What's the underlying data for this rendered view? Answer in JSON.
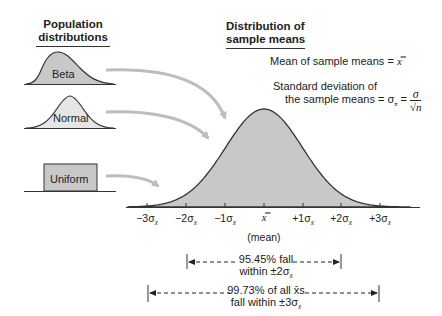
{
  "headers": {
    "population": [
      "Population",
      "distributions"
    ],
    "sampling": [
      "Distribution of",
      "sample means"
    ]
  },
  "population_shapes": [
    {
      "label": "Beta",
      "shape": "right-skewed"
    },
    {
      "label": "Normal",
      "shape": "bell"
    },
    {
      "label": "Uniform",
      "shape": "rectangle"
    }
  ],
  "formulas": {
    "mean_text": "Mean of sample means = ",
    "mean_symbol": "x̿",
    "sd_line1": "Standard deviation of",
    "sd_line2": "the sample means = σ",
    "sd_sub": "x̄",
    "sd_eq": " = ",
    "sd_num": "σ",
    "sd_den": "√n"
  },
  "axis": {
    "ticks": [
      {
        "coef": "−3σ",
        "sub": "x̄"
      },
      {
        "coef": "−2σ",
        "sub": "x̄"
      },
      {
        "coef": "−1σ",
        "sub": "x̄"
      },
      {
        "coef": "x̿",
        "sub": ""
      },
      {
        "coef": "+1σ",
        "sub": "x̄"
      },
      {
        "coef": "+2σ",
        "sub": "x̄"
      },
      {
        "coef": "+3σ",
        "sub": "x̄"
      }
    ],
    "mean_label": "(mean)"
  },
  "ranges": [
    {
      "line1": "95.45% fall",
      "line2": "within ±2σ",
      "sub": "x̄"
    },
    {
      "line1": "99.73% of all x̄s",
      "line2": "fall within ±3σ",
      "sub": "x̄"
    }
  ],
  "colors": {
    "fill": "#c8c8c8",
    "stroke": "#333333",
    "arrow": "#bdbdbd"
  },
  "chart_data": {
    "type": "area",
    "title": "Distribution of sample means",
    "xlabel": "(mean)",
    "ylabel": "",
    "categories": [
      "−3σx̄",
      "−2σx̄",
      "−1σx̄",
      "x̿",
      "+1σx̄",
      "+2σx̄",
      "+3σx̄"
    ],
    "values": [
      0.0044,
      0.054,
      0.242,
      0.399,
      0.242,
      0.054,
      0.0044
    ],
    "annotations": [
      "Mean of sample means = x̿",
      "Standard deviation of the sample means = σx̄ = σ/√n",
      "95.45% fall within ±2σx̄",
      "99.73% of all x̄s fall within ±3σx̄"
    ],
    "grid": false,
    "legend": false
  }
}
